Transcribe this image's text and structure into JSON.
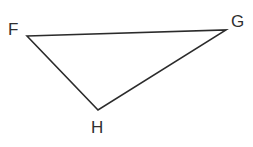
{
  "figure": {
    "name": "triangle-fgh",
    "background_color": "#ffffff",
    "stroke_color": "#2b2b2b",
    "stroke_width": 1.6,
    "label_color": "#2f2f2f",
    "width": 253,
    "height": 147
  },
  "chart_data": {
    "type": "diagram",
    "title": "",
    "shape": "triangle",
    "vertices": [
      {
        "id": "F",
        "label": "F",
        "x": 27,
        "y": 36
      },
      {
        "id": "G",
        "label": "G",
        "x": 226,
        "y": 30
      },
      {
        "id": "H",
        "label": "H",
        "x": 98,
        "y": 110
      }
    ],
    "edges": [
      {
        "from": "F",
        "to": "G"
      },
      {
        "from": "G",
        "to": "H"
      },
      {
        "from": "H",
        "to": "F"
      }
    ],
    "label_positions": [
      {
        "id": "F",
        "x": 8,
        "y": 21
      },
      {
        "id": "G",
        "x": 231,
        "y": 13
      },
      {
        "id": "H",
        "x": 91,
        "y": 119
      }
    ],
    "xlim": [
      0,
      253
    ],
    "ylim": [
      0,
      147
    ],
    "grid": false,
    "legend": false
  },
  "labels": {
    "F": "F",
    "G": "G",
    "H": "H"
  }
}
